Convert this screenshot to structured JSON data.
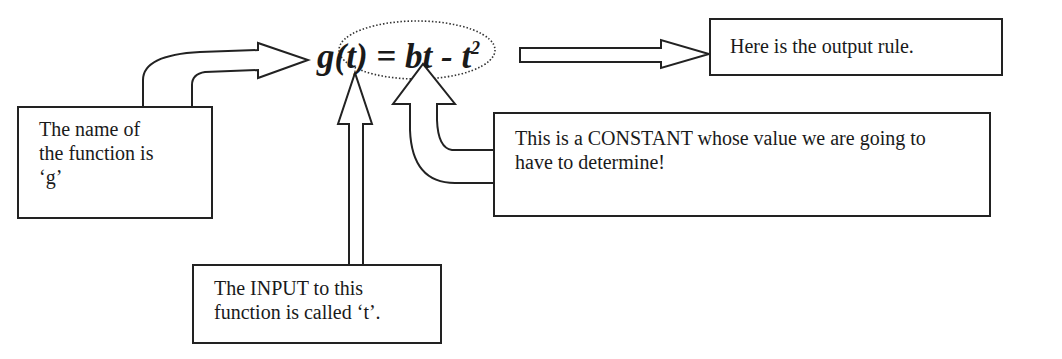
{
  "diagram": {
    "top_fragment": "",
    "formula": {
      "lhs": "g(t)",
      "equals": "=",
      "rhs_main": "bt - t",
      "rhs_exponent": "2"
    },
    "labels": {
      "function_name": "The name of the function is ‘g’",
      "function_name_lines": [
        "The name of",
        "the function is",
        "‘g’"
      ],
      "output_rule": "Here is the output rule.",
      "constant": "This is a CONSTANT whose value we are going to have to determine!",
      "constant_lines": [
        "This is a CONSTANT whose value we are going to",
        "have to determine!"
      ],
      "input": "The INPUT to this function is called ‘t’.",
      "input_lines": [
        "The INPUT to this",
        "function is called ‘t’."
      ]
    },
    "colors": {
      "stroke": "#222222",
      "background": "#ffffff",
      "dotted_ellipse": "#333333"
    }
  }
}
